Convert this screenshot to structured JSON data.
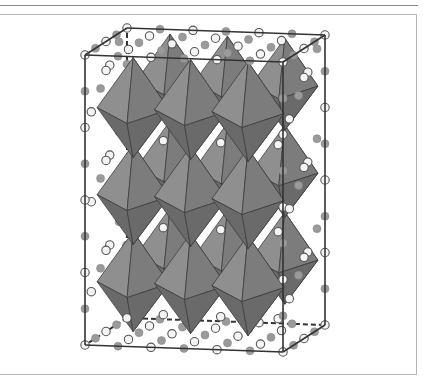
{
  "figure": {
    "cell": {
      "edge_color": "#333333",
      "hidden_edge_style": "dashed"
    },
    "octahedra": {
      "layers": 3,
      "per_layer_front": 3,
      "per_layer_back": 3,
      "face_light": "#8f8f8f",
      "face_mid": "#7c7c7c",
      "face_dark": "#6a6a6a",
      "edge_color": "#3e3e3e"
    },
    "atoms": {
      "types": [
        {
          "name": "A-site cation",
          "style": "open",
          "fill": "#f4f4f4",
          "stroke": "#555555"
        },
        {
          "name": "anion",
          "style": "filled",
          "fill": "#9a9a9a",
          "stroke": "#8a8a8a"
        }
      ]
    }
  }
}
